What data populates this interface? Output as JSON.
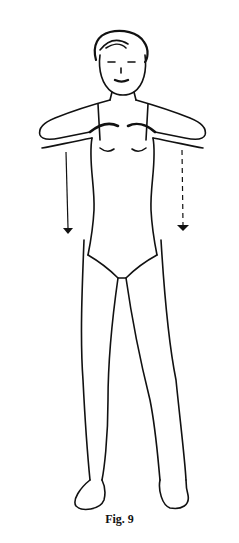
{
  "figure": {
    "caption": "Fig. 9",
    "arrows": [
      {
        "side": "left",
        "style": "solid",
        "direction": "down"
      },
      {
        "side": "right",
        "style": "dashed",
        "direction": "down"
      }
    ],
    "line_color": "#111111",
    "background": "#ffffff"
  }
}
